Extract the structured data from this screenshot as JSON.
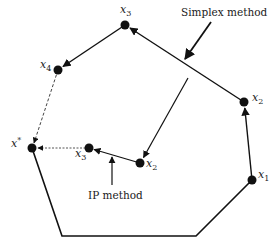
{
  "diagram": {
    "type": "feasible-region-polygon",
    "colors": {
      "stroke": "#111111",
      "dashed": "#444444",
      "background": "#ffffff"
    },
    "labels": {
      "simplex": "Simplex method",
      "ip": "IP method",
      "x_star": "x",
      "x_star_sup": "*",
      "simplex_points": [
        {
          "base": "x",
          "sub": "1"
        },
        {
          "base": "x",
          "sub": "2"
        },
        {
          "base": "x",
          "sub": "3"
        },
        {
          "base": "x",
          "sub": "4"
        }
      ],
      "ip_points": [
        {
          "base": "x",
          "sub": "2"
        },
        {
          "base": "x",
          "sub": "3"
        }
      ]
    },
    "polygon_vertices": [
      {
        "name": "x*",
        "x": 32,
        "y": 148
      },
      {
        "name": "bottom-left",
        "x": 62,
        "y": 236
      },
      {
        "name": "bottom-right",
        "x": 196,
        "y": 236
      },
      {
        "name": "x1",
        "x": 252,
        "y": 180
      },
      {
        "name": "x2",
        "x": 244,
        "y": 102
      },
      {
        "name": "x3",
        "x": 125,
        "y": 25
      },
      {
        "name": "x4",
        "x": 58,
        "y": 70
      }
    ],
    "simplex_path": [
      "x1",
      "x2",
      "x3",
      "x4",
      "x*"
    ],
    "ip_path": [
      {
        "name": "start",
        "x": 188,
        "y": 78
      },
      {
        "name": "x2",
        "x": 140,
        "y": 163
      },
      {
        "name": "x3",
        "x": 89,
        "y": 148
      },
      {
        "name": "x*",
        "x": 32,
        "y": 148
      }
    ]
  }
}
